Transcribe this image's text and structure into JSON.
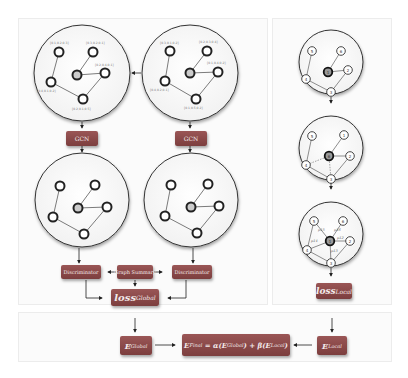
{
  "global_branch": {
    "input_graphs": [
      {
        "node_labels": [
          "[0.1,0.2,0.3]",
          "[0.3,0.2,0.1]",
          "[0.2,0.4,0.1]",
          "[0.4,0.1,0.2]",
          "[0.2,0.1,0.5]"
        ]
      },
      {
        "node_labels": [
          "[0.3,0.1,0.2]",
          "[0.2,0.3,0.4]",
          "[0.1,0.4,0.2]",
          "[0.4,0.2,0.1]",
          "[0.1,0.5,0.2]"
        ]
      }
    ],
    "gcn_left_label": "GCN",
    "gcn_right_label": "GCN",
    "discriminator_left_label": "Discriminator",
    "discriminator_right_label": "Discriminator",
    "graph_summary_label": "Graph Summary",
    "loss_label": "loss",
    "loss_subscript": "Global"
  },
  "local_branch": {
    "graph1_nodes": [
      "1",
      "2",
      "3",
      "4",
      "5",
      "6"
    ],
    "graph2_nodes": [
      "6",
      "2",
      "3",
      "4",
      "5",
      "1"
    ],
    "graph3_nodes": [
      "1",
      "2",
      "3",
      "4",
      "5",
      "6"
    ],
    "graph3_edge_labels": [
      "p15",
      "p16",
      "p12",
      "p14",
      "p13"
    ],
    "loss_label": "loss",
    "loss_subscript": "Local"
  },
  "bottom": {
    "e_global_label": "E",
    "e_global_sub": "Global",
    "e_local_label": "E",
    "e_local_sub": "Local",
    "formula": {
      "lhs": "E",
      "lhs_sub": "Final",
      "eq": " = α(",
      "t1": "E",
      "t1_sub": "Global",
      "mid": ") + β(",
      "t2": "E",
      "t2_sub": "Local",
      "end": ")"
    }
  },
  "colors": {
    "box": "#8a4848",
    "panel_bg": "#fbfbfb",
    "panel_border": "#ececec",
    "line": "#333333"
  }
}
